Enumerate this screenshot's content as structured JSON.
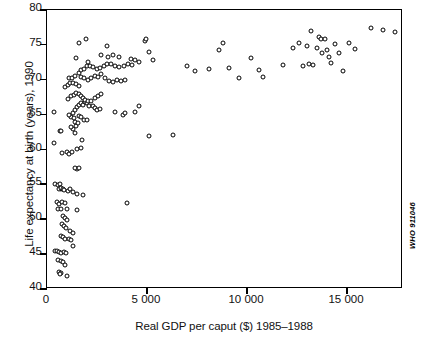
{
  "chart_data": {
    "type": "scatter",
    "title": "",
    "xlabel": "Real GDP per caput ($) 1985–1988",
    "ylabel": "Life expectancy at birth (years), 1990",
    "source_code": "WHO 911046",
    "xlim": [
      0,
      17800
    ],
    "ylim": [
      40,
      80
    ],
    "xticks": [
      0,
      5000,
      10000,
      15000
    ],
    "xtick_labels": [
      "0",
      "5 000",
      "10 000",
      "15 000"
    ],
    "yticks": [
      40,
      45,
      50,
      55,
      60,
      65,
      70,
      75,
      80
    ],
    "ytick_labels": [
      "40",
      "45",
      "50",
      "55",
      "60",
      "65",
      "70",
      "75",
      "80"
    ],
    "grid": false,
    "legend": null,
    "marker": "open-circle",
    "marker_color": "#000000",
    "points": [
      [
        360,
        65.4
      ],
      [
        640,
        62.6
      ],
      [
        330,
        61.0
      ],
      [
        690,
        62.7
      ],
      [
        1000,
        59.6
      ],
      [
        760,
        59.5
      ],
      [
        1080,
        59.3
      ],
      [
        1250,
        59.6
      ],
      [
        420,
        55.0
      ],
      [
        560,
        54.9
      ],
      [
        640,
        55.0
      ],
      [
        690,
        54.4
      ],
      [
        600,
        54.3
      ],
      [
        720,
        54.5
      ],
      [
        780,
        54.3
      ],
      [
        840,
        54.2
      ],
      [
        1030,
        54.1
      ],
      [
        1150,
        54.4
      ],
      [
        1280,
        53.9
      ],
      [
        1480,
        53.6
      ],
      [
        1800,
        53.5
      ],
      [
        3980,
        52.4
      ],
      [
        520,
        52.5
      ],
      [
        620,
        52.2
      ],
      [
        760,
        52.5
      ],
      [
        880,
        52.3
      ],
      [
        540,
        51.5
      ],
      [
        700,
        51.4
      ],
      [
        980,
        51.4
      ],
      [
        1500,
        51.3
      ],
      [
        800,
        50.4
      ],
      [
        900,
        50.2
      ],
      [
        1000,
        49.9
      ],
      [
        760,
        49.3
      ],
      [
        840,
        49.0
      ],
      [
        940,
        48.8
      ],
      [
        1130,
        48.3
      ],
      [
        1280,
        48.1
      ],
      [
        700,
        47.6
      ],
      [
        800,
        47.4
      ],
      [
        900,
        47.2
      ],
      [
        1080,
        47.2
      ],
      [
        1200,
        47.0
      ],
      [
        1320,
        46.2
      ],
      [
        420,
        45.5
      ],
      [
        520,
        45.4
      ],
      [
        620,
        45.3
      ],
      [
        720,
        45.1
      ],
      [
        840,
        45.3
      ],
      [
        960,
        45.2
      ],
      [
        560,
        44.2
      ],
      [
        680,
        44.0
      ],
      [
        820,
        43.9
      ],
      [
        900,
        43.4
      ],
      [
        600,
        42.4
      ],
      [
        700,
        42.3
      ],
      [
        660,
        42.1
      ],
      [
        1000,
        41.8
      ],
      [
        1500,
        57.2
      ],
      [
        1420,
        57.4
      ],
      [
        1620,
        57.3
      ],
      [
        1500,
        60.1
      ],
      [
        1680,
        60.2
      ],
      [
        1750,
        61.4
      ],
      [
        1380,
        62.4
      ],
      [
        1280,
        63.0
      ],
      [
        1200,
        63.2
      ],
      [
        1450,
        63.4
      ],
      [
        1380,
        63.9
      ],
      [
        1560,
        63.8
      ],
      [
        1200,
        64.6
      ],
      [
        1340,
        64.5
      ],
      [
        1600,
        64.8
      ],
      [
        1720,
        64.6
      ],
      [
        1840,
        64.2
      ],
      [
        2000,
        64.3
      ],
      [
        1100,
        64.9
      ],
      [
        1280,
        65.2
      ],
      [
        1420,
        65.6
      ],
      [
        1500,
        66.1
      ],
      [
        1620,
        66.4
      ],
      [
        1720,
        66.6
      ],
      [
        1800,
        66.4
      ],
      [
        1880,
        66.8
      ],
      [
        1980,
        66.7
      ],
      [
        2100,
        66.3
      ],
      [
        2300,
        66.2
      ],
      [
        2400,
        65.9
      ],
      [
        2500,
        65.6
      ],
      [
        2650,
        65.8
      ],
      [
        3400,
        65.4
      ],
      [
        3800,
        65.0
      ],
      [
        3900,
        65.2
      ],
      [
        4400,
        65.4
      ],
      [
        4600,
        66.2
      ],
      [
        5100,
        62.0
      ],
      [
        6300,
        62.1
      ],
      [
        1050,
        67.3
      ],
      [
        1200,
        67.6
      ],
      [
        1340,
        67.8
      ],
      [
        1450,
        68.1
      ],
      [
        1620,
        67.9
      ],
      [
        1720,
        67.7
      ],
      [
        1820,
        67.4
      ],
      [
        1920,
        67.1
      ],
      [
        2050,
        66.9
      ],
      [
        2180,
        67.0
      ],
      [
        2400,
        67.4
      ],
      [
        2550,
        67.6
      ],
      [
        2700,
        68.0
      ],
      [
        900,
        68.9
      ],
      [
        1050,
        69.3
      ],
      [
        1160,
        69.5
      ],
      [
        1280,
        69.6
      ],
      [
        1450,
        69.4
      ],
      [
        1600,
        69.1
      ],
      [
        1100,
        70.2
      ],
      [
        1250,
        70.3
      ],
      [
        1400,
        70.6
      ],
      [
        1580,
        70.9
      ],
      [
        1700,
        70.4
      ],
      [
        1850,
        70.2
      ],
      [
        2050,
        69.9
      ],
      [
        2200,
        70.3
      ],
      [
        2400,
        70.6
      ],
      [
        2550,
        70.4
      ],
      [
        2700,
        70.8
      ],
      [
        2900,
        70.2
      ],
      [
        3100,
        69.8
      ],
      [
        3300,
        69.7
      ],
      [
        3500,
        69.9
      ],
      [
        3700,
        69.8
      ],
      [
        3900,
        70.0
      ],
      [
        1700,
        71.4
      ],
      [
        1850,
        71.6
      ],
      [
        2000,
        71.9
      ],
      [
        2150,
        72.0
      ],
      [
        2300,
        71.8
      ],
      [
        2480,
        71.5
      ],
      [
        2650,
        71.7
      ],
      [
        2850,
        71.9
      ],
      [
        3000,
        72.2
      ],
      [
        3200,
        72.3
      ],
      [
        3400,
        72.0
      ],
      [
        3600,
        71.8
      ],
      [
        3850,
        72.0
      ],
      [
        4050,
        72.3
      ],
      [
        4250,
        72.1
      ],
      [
        1450,
        73.1
      ],
      [
        2050,
        72.6
      ],
      [
        2700,
        73.5
      ],
      [
        3050,
        73.3
      ],
      [
        3300,
        73.6
      ],
      [
        3600,
        73.2
      ],
      [
        4200,
        73.0
      ],
      [
        4400,
        72.8
      ],
      [
        4600,
        72.6
      ],
      [
        5100,
        74.0
      ],
      [
        5300,
        72.9
      ],
      [
        1600,
        75.2
      ],
      [
        1950,
        75.8
      ],
      [
        3000,
        74.8
      ],
      [
        4900,
        75.5
      ],
      [
        4950,
        75.9
      ],
      [
        7000,
        71.9
      ],
      [
        7400,
        71.2
      ],
      [
        8100,
        71.5
      ],
      [
        8600,
        74.3
      ],
      [
        8800,
        75.2
      ],
      [
        9100,
        71.7
      ],
      [
        9600,
        70.2
      ],
      [
        10200,
        73.1
      ],
      [
        10600,
        71.4
      ],
      [
        10800,
        70.4
      ],
      [
        11800,
        72.1
      ],
      [
        12300,
        74.5
      ],
      [
        12600,
        75.2
      ],
      [
        12800,
        71.9
      ],
      [
        13000,
        74.8
      ],
      [
        13100,
        72.3
      ],
      [
        13200,
        77.0
      ],
      [
        13300,
        72.1
      ],
      [
        13500,
        74.6
      ],
      [
        13600,
        76.1
      ],
      [
        13700,
        75.8
      ],
      [
        13750,
        73.9
      ],
      [
        13900,
        75.9
      ],
      [
        14000,
        74.2
      ],
      [
        14100,
        73.3
      ],
      [
        14200,
        72.4
      ],
      [
        14400,
        75.1
      ],
      [
        14600,
        73.8
      ],
      [
        14800,
        71.2
      ],
      [
        15100,
        75.2
      ],
      [
        15400,
        74.4
      ],
      [
        16200,
        77.4
      ],
      [
        16800,
        77.2
      ],
      [
        17400,
        76.9
      ]
    ]
  }
}
